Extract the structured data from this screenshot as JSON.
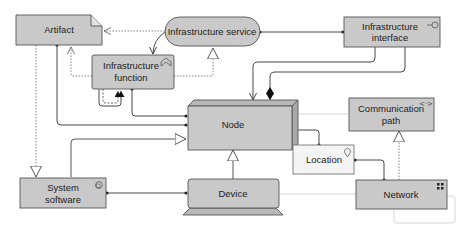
{
  "diagram": {
    "colors": {
      "element_fill": "#c9c9c9",
      "location_fill": "#f4f4f4",
      "border": "#555555",
      "line": "#333333",
      "dotted_line": "#777777",
      "faint_line": "#d6d6d6"
    },
    "elements": {
      "artifact": {
        "label": "Artifact",
        "icon": "artifact-icon"
      },
      "infrastructure_service": {
        "label": "Infrastructure service",
        "icon": "service-icon"
      },
      "infrastructure_interface": {
        "label_line1": "Infrastructure",
        "label_line2": "interface",
        "icon": "interface-icon"
      },
      "infrastructure_function": {
        "label_line1": "Infrastructure",
        "label_line2": "function",
        "icon": "function-icon"
      },
      "node": {
        "label": "Node",
        "icon": "node-icon"
      },
      "communication_path": {
        "label_line1": "Communication",
        "label_line2": "path",
        "icon": "communication-path-icon"
      },
      "location": {
        "label": "Location",
        "icon": "location-pin-icon"
      },
      "system_software": {
        "label_line1": "System",
        "label_line2": "software",
        "icon": "system-software-icon"
      },
      "device": {
        "label": "Device",
        "icon": "device-icon"
      },
      "network": {
        "label": "Network",
        "icon": "network-icon"
      }
    },
    "relationships": [
      {
        "from": "infrastructure_interface",
        "to": "infrastructure_service",
        "type": "assignment"
      },
      {
        "from": "infrastructure_interface",
        "to": "node",
        "type": "assignment"
      },
      {
        "from": "infrastructure_interface",
        "to": "node",
        "type": "composition"
      },
      {
        "from": "infrastructure_service",
        "to": "infrastructure_function",
        "type": "used-by"
      },
      {
        "from": "infrastructure_service",
        "to": "artifact",
        "type": "access"
      },
      {
        "from": "infrastructure_function",
        "to": "infrastructure_service",
        "type": "realization"
      },
      {
        "from": "infrastructure_function",
        "to": "artifact",
        "type": "access"
      },
      {
        "from": "infrastructure_function",
        "to": "infrastructure_function",
        "type": "triggering-flow"
      },
      {
        "from": "infrastructure_function",
        "to": "node",
        "type": "assignment"
      },
      {
        "from": "artifact",
        "to": "node",
        "type": "assignment"
      },
      {
        "from": "artifact",
        "to": "system_software",
        "type": "realization"
      },
      {
        "from": "system_software",
        "to": "node",
        "type": "specialization"
      },
      {
        "from": "system_software",
        "to": "device",
        "type": "assignment"
      },
      {
        "from": "device",
        "to": "node",
        "type": "specialization"
      },
      {
        "from": "node",
        "to": "location",
        "type": "assignment"
      },
      {
        "from": "location",
        "to": "network",
        "type": "assignment"
      },
      {
        "from": "network",
        "to": "communication_path",
        "type": "realization"
      },
      {
        "from": "node",
        "to": "communication_path",
        "type": "association"
      },
      {
        "from": "device",
        "to": "network",
        "type": "association"
      },
      {
        "from": "network",
        "to": "network",
        "type": "association"
      }
    ]
  }
}
